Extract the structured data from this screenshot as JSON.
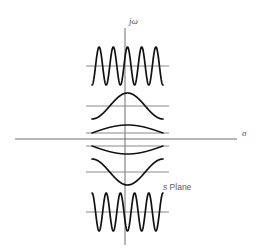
{
  "figure": {
    "name": "s-plane-impulse-response-locations",
    "plane_label": "s Plane",
    "plane_label_italic_part": "s",
    "plane_label_rest": " Plane",
    "axes": {
      "vertical_label": "jω",
      "horizontal_label": "σ",
      "vertical_axis_x": 125,
      "vertical_axis_top": 28,
      "vertical_axis_bottom": 245,
      "horizontal_axis_y": 139,
      "horizontal_axis_left": 15,
      "horizontal_axis_right": 237
    },
    "colors": {
      "axis": "#6f6f6f",
      "baseline": "#8a8a8a",
      "wave": "#111111",
      "label": "#4a4a4a",
      "background": "#ffffff"
    },
    "waveforms": [
      {
        "name": "wave-top-undamped-high-freq",
        "baseline_y": 66,
        "x_start": 92,
        "x_end": 163,
        "cycles": 5,
        "amplitude": 19,
        "phase": "cosine-peak-center",
        "description": "high frequency sustained oscillation, far from real axis (upper)"
      },
      {
        "name": "wave-upper-single-hump",
        "baseline_y": 106,
        "x_start": 92,
        "x_end": 163,
        "cycles": 1,
        "amplitude": 13,
        "phase": "cosine-peak-center",
        "description": "low frequency single positive hump, closer to real axis (upper)"
      },
      {
        "name": "wave-upper-shallow-arc",
        "baseline_y": 133,
        "x_start": 92,
        "x_end": 163,
        "cycles": 0.5,
        "amplitude": 8,
        "phase": "positive-arc",
        "description": "very low frequency shallow arc just above the real axis"
      },
      {
        "name": "wave-lower-shallow-arc",
        "baseline_y": 146,
        "x_start": 92,
        "x_end": 163,
        "cycles": 0.5,
        "amplitude": -8,
        "phase": "negative-arc",
        "description": "very low frequency shallow arc just below the real axis"
      },
      {
        "name": "wave-lower-single-dip",
        "baseline_y": 172,
        "x_start": 92,
        "x_end": 163,
        "cycles": 1,
        "amplitude": -13,
        "phase": "inverted-cosine-trough-center",
        "description": "low frequency single negative dip, closer to real axis (lower)"
      },
      {
        "name": "wave-bottom-undamped-high-freq",
        "baseline_y": 212,
        "x_start": 92,
        "x_end": 163,
        "cycles": 5,
        "amplitude": 19,
        "phase": "inverted-cosine-trough-center",
        "description": "high frequency sustained oscillation, far from real axis (lower)"
      }
    ]
  }
}
